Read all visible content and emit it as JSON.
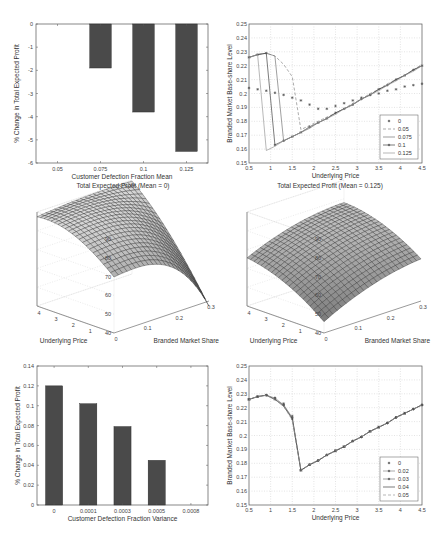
{
  "chart_data": [
    {
      "id": "p1",
      "type": "bar",
      "title": "",
      "xlabel": "Customer Defection Fraction Mean",
      "ylabel": "% Change in Total Expected Profit",
      "categories": [
        "0.05",
        "0.075",
        "0.1",
        "0.125"
      ],
      "values": [
        0,
        -1.9,
        -3.8,
        -5.5
      ],
      "ylim": [
        -6,
        0
      ],
      "yticks": [
        "0",
        "-1",
        "-2",
        "-3",
        "-4",
        "-5",
        "-6"
      ],
      "grid": false,
      "bar_color": "#4a4a4a"
    },
    {
      "id": "p2",
      "type": "line",
      "title": "",
      "xlabel": "Underlying Price",
      "ylabel": "Branded Market Base-share Level",
      "xlim": [
        0.5,
        4.5
      ],
      "ylim": [
        0.15,
        0.25
      ],
      "xticks": [
        "0.5",
        "1",
        "1.5",
        "2",
        "2.5",
        "3",
        "3.5",
        "4",
        "4.5"
      ],
      "yticks": [
        "0.15",
        "0.16",
        "0.17",
        "0.18",
        "0.19",
        "0.2",
        "0.21",
        "0.22",
        "0.23",
        "0.24",
        "0.25"
      ],
      "grid": true,
      "legend_position": "lower right",
      "x": [
        0.5,
        0.7,
        0.9,
        1.1,
        1.3,
        1.5,
        1.7,
        1.9,
        2.1,
        2.3,
        2.5,
        2.7,
        2.9,
        3.1,
        3.3,
        3.5,
        3.7,
        3.9,
        4.1,
        4.3,
        4.5
      ],
      "series": [
        {
          "name": "0",
          "style": "markers-star",
          "values": [
            0.204,
            0.203,
            0.202,
            0.2005,
            0.199,
            0.197,
            0.195,
            0.192,
            0.189,
            0.189,
            0.191,
            0.193,
            0.195,
            0.197,
            0.199,
            0.2,
            0.202,
            0.203,
            0.205,
            0.206,
            0.207
          ]
        },
        {
          "name": "0.05",
          "style": "dashed",
          "values": [
            0.226,
            0.228,
            0.229,
            0.227,
            0.221,
            0.212,
            0.174,
            0.177,
            0.18,
            0.183,
            0.186,
            0.189,
            0.193,
            0.196,
            0.2,
            0.203,
            0.207,
            0.21,
            0.213,
            0.217,
            0.221
          ]
        },
        {
          "name": "0.075",
          "style": "solid-thin",
          "values": [
            0.226,
            0.228,
            0.229,
            0.227,
            0.166,
            0.169,
            0.172,
            0.175,
            0.179,
            0.182,
            0.186,
            0.189,
            0.192,
            0.196,
            0.199,
            0.203,
            0.206,
            0.21,
            0.213,
            0.217,
            0.22
          ]
        },
        {
          "name": "0.1",
          "style": "solid-markers",
          "values": [
            0.226,
            0.228,
            0.229,
            0.163,
            0.166,
            0.169,
            0.172,
            0.176,
            0.179,
            0.182,
            0.186,
            0.189,
            0.192,
            0.196,
            0.199,
            0.203,
            0.206,
            0.21,
            0.213,
            0.217,
            0.22
          ]
        },
        {
          "name": "0.125",
          "style": "solid",
          "values": [
            0.226,
            0.228,
            0.159,
            0.162,
            0.166,
            0.169,
            0.172,
            0.176,
            0.179,
            0.182,
            0.185,
            0.189,
            0.192,
            0.196,
            0.199,
            0.202,
            0.206,
            0.209,
            0.213,
            0.216,
            0.22
          ]
        }
      ]
    },
    {
      "id": "p3",
      "type": "surface",
      "title": "Total Expected Profit (Mean = 0)",
      "xlabel": "Branded Market Share",
      "ylabel": "Underlying Price",
      "zlim": [
        40,
        90
      ],
      "zticks": [
        "40",
        "50",
        "60",
        "70",
        "80",
        "90"
      ],
      "xticks": [
        "0",
        "0.1",
        "0.2",
        "0.3"
      ],
      "yticks": [
        "1",
        "2",
        "3",
        "4"
      ],
      "corner_values": {
        "back_left": 78,
        "back_right_peak": 88,
        "front_left": 52,
        "front_right": 41
      }
    },
    {
      "id": "p4",
      "type": "surface",
      "title": "Total Expected Profit (Mean = 0.125)",
      "xlabel": "Branded Market Share",
      "ylabel": "Underlying Price",
      "zlim": [
        40,
        90
      ],
      "zticks": [
        "40",
        "50",
        "60",
        "70",
        "80",
        "90"
      ],
      "xticks": [
        "0",
        "0.1",
        "0.2",
        "0.3"
      ],
      "yticks": [
        "1",
        "2",
        "3",
        "4"
      ],
      "corner_values": {
        "back_left": 71,
        "back_right_peak": 84,
        "front_left": 43,
        "front_right": 55
      }
    },
    {
      "id": "p5",
      "type": "bar",
      "title": "",
      "xlabel": "Customer Defection Fraction Variance",
      "ylabel": "% Change in Total Expected Profit",
      "categories": [
        "0",
        "0.0001",
        "0.0003",
        "0.0005",
        "0.0008"
      ],
      "values": [
        0.12,
        0.102,
        0.079,
        0.045,
        0
      ],
      "ylim": [
        0,
        0.14
      ],
      "yticks": [
        "0",
        "0.02",
        "0.04",
        "0.06",
        "0.08",
        "0.1",
        "0.12",
        "0.14"
      ],
      "grid": false,
      "bar_color": "#4a4a4a"
    },
    {
      "id": "p6",
      "type": "line",
      "title": "",
      "xlabel": "Underlying Price",
      "ylabel": "Branded Market Base-share Level",
      "xlim": [
        0.5,
        4.5
      ],
      "ylim": [
        0.15,
        0.25
      ],
      "xticks": [
        "0.5",
        "1",
        "1.5",
        "2",
        "2.5",
        "3",
        "3.5",
        "4",
        "4.5"
      ],
      "yticks": [
        "0.15",
        "0.16",
        "0.17",
        "0.18",
        "0.19",
        "0.2",
        "0.21",
        "0.22",
        "0.23",
        "0.24",
        "0.25"
      ],
      "grid": true,
      "legend_position": "lower right",
      "x": [
        0.5,
        0.7,
        0.9,
        1.1,
        1.3,
        1.5,
        1.7,
        1.9,
        2.1,
        2.3,
        2.5,
        2.7,
        2.9,
        3.1,
        3.3,
        3.5,
        3.7,
        3.9,
        4.1,
        4.3,
        4.5
      ],
      "series": [
        {
          "name": "0",
          "style": "markers-star",
          "values": [
            0.226,
            0.228,
            0.229,
            0.227,
            0.223,
            0.214,
            0.175,
            0.179,
            0.182,
            0.186,
            0.189,
            0.192,
            0.196,
            0.199,
            0.203,
            0.206,
            0.209,
            0.213,
            0.216,
            0.219,
            0.222
          ]
        },
        {
          "name": "0.02",
          "style": "solid-markers",
          "values": [
            0.226,
            0.228,
            0.229,
            0.227,
            0.222,
            0.213,
            0.175,
            0.179,
            0.182,
            0.186,
            0.189,
            0.192,
            0.196,
            0.199,
            0.203,
            0.206,
            0.209,
            0.213,
            0.216,
            0.219,
            0.222
          ]
        },
        {
          "name": "0.03",
          "style": "solid-markers",
          "values": [
            0.226,
            0.228,
            0.229,
            0.226,
            0.222,
            0.212,
            0.175,
            0.179,
            0.182,
            0.186,
            0.189,
            0.192,
            0.196,
            0.199,
            0.203,
            0.206,
            0.209,
            0.213,
            0.216,
            0.219,
            0.222
          ]
        },
        {
          "name": "0.04",
          "style": "solid",
          "values": [
            0.226,
            0.228,
            0.229,
            0.226,
            0.221,
            0.212,
            0.175,
            0.179,
            0.182,
            0.186,
            0.189,
            0.192,
            0.196,
            0.199,
            0.203,
            0.206,
            0.209,
            0.213,
            0.216,
            0.219,
            0.222
          ]
        },
        {
          "name": "0.05",
          "style": "dashed",
          "values": [
            0.226,
            0.228,
            0.229,
            0.226,
            0.221,
            0.211,
            0.175,
            0.179,
            0.182,
            0.186,
            0.189,
            0.192,
            0.196,
            0.199,
            0.203,
            0.206,
            0.209,
            0.213,
            0.216,
            0.219,
            0.222
          ]
        }
      ]
    }
  ]
}
